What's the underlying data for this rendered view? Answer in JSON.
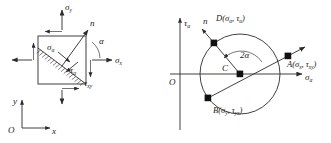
{
  "figure": {
    "left_diagram": {
      "name": "stress-element-diagram",
      "labels": {
        "sigma_y": "σ",
        "sigma_y_sub": "y",
        "sigma_x": "σ",
        "sigma_x_sub": "x",
        "sigma_alpha": "σ",
        "sigma_alpha_sub": "α",
        "tau_alpha": "τ",
        "tau_alpha_sub": "α",
        "tau_xy": "τ",
        "tau_xy_sub": "xy",
        "normal_n": "n",
        "angle_alpha": "α",
        "axis_y": "y",
        "axis_x": "x",
        "origin": "O"
      }
    },
    "right_diagram": {
      "name": "mohrs-circle-diagram",
      "labels": {
        "axis_tau": "τ",
        "axis_tau_sub": "α",
        "axis_sigma": "σ",
        "axis_sigma_sub": "α",
        "origin": "O",
        "center": "C",
        "normal_n": "n",
        "angle_2alpha": "2α",
        "point_D": "D(σ",
        "point_D_sub1": "α",
        "point_D_mid": ", τ",
        "point_D_sub2": "α",
        "point_D_end": ")",
        "point_A": "A(σ",
        "point_A_sub1": "x",
        "point_A_mid": ", τ",
        "point_A_sub2": "xy",
        "point_A_end": ")",
        "point_B": "B(σ",
        "point_B_sub1": "y",
        "point_B_mid": ", τ",
        "point_B_sub2": "yx",
        "point_B_end": ")"
      }
    },
    "colors": {
      "line": "#2b2b2b",
      "text": "#1a1a1a",
      "background": "#ffffff",
      "marker": "#111111"
    }
  }
}
